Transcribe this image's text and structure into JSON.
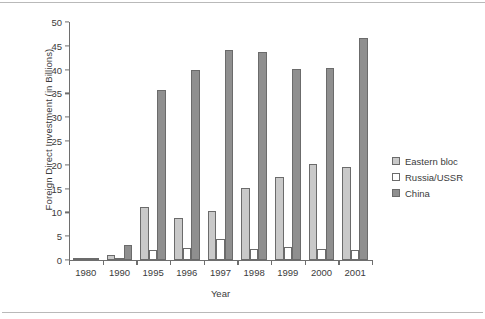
{
  "chart_data": {
    "type": "bar",
    "title": "",
    "xlabel": "Year",
    "ylabel": "Foreign Direct Investment (in Billions)",
    "categories": [
      "1980",
      "1990",
      "1995",
      "1996",
      "1997",
      "1998",
      "1999",
      "2000",
      "2001"
    ],
    "series": [
      {
        "name": "Eastern bloc",
        "color": "#c9c9c9",
        "values": [
          0.2,
          1.0,
          11.2,
          8.8,
          10.2,
          15.2,
          17.5,
          20.2,
          19.5
        ]
      },
      {
        "name": "Russia/USSR",
        "color": "#ffffff",
        "values": [
          0.1,
          0.2,
          2.0,
          2.5,
          4.5,
          2.3,
          2.8,
          2.3,
          2.0
        ]
      },
      {
        "name": "China",
        "color": "#8f8f8f",
        "values": [
          0.3,
          3.2,
          35.8,
          40.0,
          44.2,
          43.8,
          40.1,
          40.4,
          46.6
        ]
      }
    ],
    "ylim": [
      0,
      50
    ],
    "ytick_step": 5,
    "yticks": [
      "0",
      "5",
      "10",
      "15",
      "20",
      "25",
      "30",
      "35",
      "40",
      "45",
      "50"
    ],
    "grid": false,
    "legend_position": "right"
  }
}
